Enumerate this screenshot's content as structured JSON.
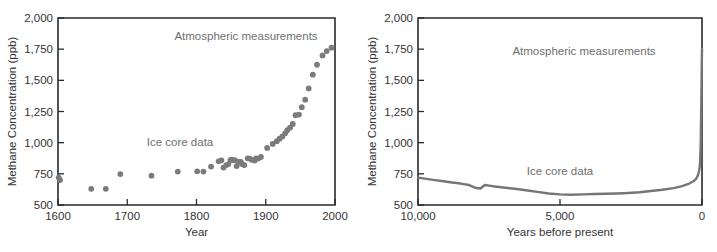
{
  "figure": {
    "title": "",
    "panels": [
      {
        "id": "left",
        "annotations": {
          "atmospheric": "Atmospheric measurements",
          "icecore": "Ice core data"
        }
      },
      {
        "id": "right",
        "annotations": {
          "atmospheric": "Atmospheric measurements",
          "icecore": "Ice core data"
        }
      }
    ]
  },
  "chart_data": [
    {
      "type": "scatter",
      "title": "",
      "xlabel": "Year",
      "ylabel": "Methane Concentration (ppb)",
      "xlim": [
        1600,
        2000
      ],
      "ylim": [
        500,
        2000
      ],
      "xticks": [
        1600,
        1700,
        1800,
        1900,
        2000
      ],
      "xticklabels": [
        "1600",
        "1700",
        "1800",
        "1900",
        "2000"
      ],
      "yticks": [
        500,
        750,
        1000,
        1250,
        1500,
        1750,
        2000
      ],
      "yticklabels": [
        "500",
        "750",
        "1,000",
        "1,250",
        "1,500",
        "1,750",
        "2,000"
      ],
      "grid": false,
      "legend": "none",
      "annotations": [
        {
          "text": "Atmospheric measurements",
          "x": 1870,
          "y": 1790
        },
        {
          "text": "Ice core data",
          "x": 1775,
          "y": 1010
        }
      ],
      "series": [
        {
          "name": "Methane concentration",
          "marker": "circle",
          "color": "#7b7b7b",
          "points": [
            [
              1601,
              720
            ],
            [
              1603,
              700
            ],
            [
              1648,
              630
            ],
            [
              1669,
              630
            ],
            [
              1690,
              748
            ],
            [
              1735,
              735
            ],
            [
              1773,
              768
            ],
            [
              1801,
              770
            ],
            [
              1810,
              768
            ],
            [
              1821,
              808
            ],
            [
              1832,
              850
            ],
            [
              1836,
              858
            ],
            [
              1839,
              800
            ],
            [
              1843,
              820
            ],
            [
              1846,
              828
            ],
            [
              1849,
              860
            ],
            [
              1851,
              862
            ],
            [
              1853,
              862
            ],
            [
              1856,
              858
            ],
            [
              1858,
              812
            ],
            [
              1861,
              845
            ],
            [
              1864,
              846
            ],
            [
              1866,
              828
            ],
            [
              1869,
              820
            ],
            [
              1874,
              874
            ],
            [
              1877,
              872
            ],
            [
              1880,
              862
            ],
            [
              1884,
              856
            ],
            [
              1886,
              874
            ],
            [
              1889,
              872
            ],
            [
              1893,
              885
            ],
            [
              1902,
              958
            ],
            [
              1910,
              990
            ],
            [
              1916,
              1012
            ],
            [
              1920,
              1032
            ],
            [
              1924,
              1050
            ],
            [
              1928,
              1075
            ],
            [
              1931,
              1100
            ],
            [
              1935,
              1120
            ],
            [
              1939,
              1150
            ],
            [
              1943,
              1220
            ],
            [
              1948,
              1225
            ],
            [
              1952,
              1285
            ],
            [
              1957,
              1345
            ],
            [
              1962,
              1435
            ],
            [
              1968,
              1545
            ],
            [
              1974,
              1625
            ],
            [
              1982,
              1700
            ],
            [
              1988,
              1735
            ],
            [
              1995,
              1762
            ]
          ]
        }
      ]
    },
    {
      "type": "line",
      "title": "",
      "xlabel": "Years before present",
      "ylabel": "Methane Concentration (ppb)",
      "xlim": [
        10000,
        0
      ],
      "ylim": [
        500,
        2000
      ],
      "xticks": [
        10000,
        5000,
        0
      ],
      "xticklabels": [
        "10,000",
        "5,000",
        "0"
      ],
      "yticks": [
        500,
        750,
        1000,
        1250,
        1500,
        1750,
        2000
      ],
      "yticklabels": [
        "500",
        "750",
        "1,000",
        "1,250",
        "1,500",
        "1,750",
        "2,000"
      ],
      "grid": false,
      "legend": "none",
      "annotations": [
        {
          "text": "Atmospheric measurements",
          "x": 4200,
          "y": 1735
        },
        {
          "text": "Ice core data",
          "x": 5000,
          "y": 730
        }
      ],
      "series": [
        {
          "name": "Methane concentration",
          "color": "#767676",
          "x": [
            10000,
            9700,
            9400,
            9100,
            8800,
            8500,
            8200,
            7950,
            7800,
            7650,
            7500,
            7300,
            7000,
            6600,
            6200,
            5800,
            5400,
            5000,
            4600,
            4200,
            3800,
            3400,
            3000,
            2600,
            2200,
            1800,
            1400,
            1000,
            700,
            450,
            300,
            200,
            140,
            100,
            70,
            45,
            25,
            10,
            0
          ],
          "y": [
            720,
            710,
            700,
            690,
            680,
            672,
            660,
            636,
            632,
            660,
            655,
            648,
            640,
            630,
            618,
            605,
            592,
            585,
            582,
            585,
            588,
            590,
            592,
            596,
            602,
            612,
            622,
            635,
            652,
            672,
            690,
            712,
            740,
            775,
            830,
            1000,
            1320,
            1600,
            1752
          ]
        }
      ]
    }
  ]
}
